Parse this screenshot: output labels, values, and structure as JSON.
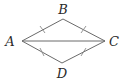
{
  "diagram": {
    "type": "rhombus",
    "vertices": [
      {
        "name": "A",
        "x": 22,
        "y": 41,
        "label_x": 10,
        "label_y": 46
      },
      {
        "name": "B",
        "x": 63,
        "y": 19,
        "label_x": 63,
        "label_y": 14
      },
      {
        "name": "C",
        "x": 105,
        "y": 41,
        "label_x": 114,
        "label_y": 46
      },
      {
        "name": "D",
        "x": 62,
        "y": 63,
        "label_x": 62,
        "label_y": 78
      }
    ],
    "edges": [
      {
        "from": "A",
        "to": "B",
        "tick_marks": 1
      },
      {
        "from": "B",
        "to": "C",
        "tick_marks": 1
      },
      {
        "from": "C",
        "to": "D",
        "tick_marks": 1
      },
      {
        "from": "D",
        "to": "A",
        "tick_marks": 1
      },
      {
        "from": "A",
        "to": "C",
        "tick_marks": 0,
        "kind": "diagonal"
      }
    ],
    "labels": {
      "A": "A",
      "B": "B",
      "C": "C",
      "D": "D"
    },
    "colors": {
      "line": "#6a6a6a",
      "tick": "#8a8a8a",
      "text": "#2a2a2a",
      "background": "#ffffff"
    }
  }
}
